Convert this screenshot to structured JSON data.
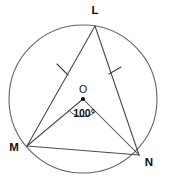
{
  "figure": {
    "type": "circle-geometry-diagram",
    "background_color": "#ffffff",
    "stroke_color": "#4a4a4a",
    "circle_stroke_color": "#666666",
    "label_color": "#111111"
  },
  "circle": {
    "center_label": "O",
    "center_x": 83,
    "center_y": 99,
    "radius": 74
  },
  "points": {
    "L": {
      "label": "L",
      "x": 95,
      "y": 26,
      "label_x": 95,
      "label_y": 12
    },
    "M": {
      "label": "M",
      "x": 27,
      "y": 146,
      "label_x": 14,
      "label_y": 151
    },
    "N": {
      "label": "N",
      "x": 139,
      "y": 155,
      "label_x": 149,
      "label_y": 165
    },
    "O": {
      "label": "O",
      "x": 83,
      "y": 99,
      "label_x": 83,
      "label_y": 93
    }
  },
  "segments": [
    {
      "name": "chord-LM",
      "from": "L",
      "to": "M",
      "tick_marks": 1
    },
    {
      "name": "chord-LN",
      "from": "L",
      "to": "N",
      "tick_marks": 1
    },
    {
      "name": "chord-MN",
      "from": "M",
      "to": "N",
      "tick_marks": 0
    },
    {
      "name": "radius-OM",
      "from": "O",
      "to": "M",
      "tick_marks": 0
    },
    {
      "name": "radius-ON",
      "from": "O",
      "to": "N",
      "tick_marks": 0
    }
  ],
  "angle": {
    "name": "central-angle-MON",
    "vertex": "O",
    "value_text": "100°",
    "value_number": 100,
    "units": "degrees",
    "arc_radius": 18,
    "label_x": 84,
    "label_y": 117
  },
  "tick_marks": [
    {
      "name": "tick-on-LM",
      "x": 62,
      "y": 70,
      "angle_deg": 61
    },
    {
      "name": "tick-on-LN",
      "x": 115,
      "y": 71,
      "angle_deg": -70
    }
  ]
}
